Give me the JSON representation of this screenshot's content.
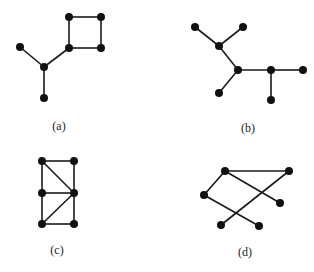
{
  "style": {
    "edge_color": "#1a1a1a",
    "node_color": "#111111",
    "node_radius": 4,
    "edge_width": 1.6
  },
  "graphs": [
    {
      "label": "(a)",
      "label_pos": [
        59,
        126
      ],
      "nodes": [
        [
          69,
          17
        ],
        [
          101,
          17
        ],
        [
          69,
          48
        ],
        [
          101,
          48
        ],
        [
          44,
          67
        ],
        [
          20,
          47
        ],
        [
          44,
          98
        ]
      ],
      "edges": [
        [
          0,
          1
        ],
        [
          1,
          3
        ],
        [
          3,
          2
        ],
        [
          2,
          0
        ],
        [
          2,
          4
        ],
        [
          5,
          4
        ],
        [
          4,
          6
        ]
      ]
    },
    {
      "label": "(b)",
      "label_pos": [
        248,
        128
      ],
      "nodes": [
        [
          195,
          27
        ],
        [
          243,
          27
        ],
        [
          219,
          46
        ],
        [
          238,
          70
        ],
        [
          271,
          70
        ],
        [
          303,
          70
        ],
        [
          219,
          93
        ],
        [
          271,
          100
        ]
      ],
      "edges": [
        [
          0,
          2
        ],
        [
          1,
          2
        ],
        [
          2,
          3
        ],
        [
          3,
          6
        ],
        [
          3,
          4
        ],
        [
          4,
          5
        ],
        [
          4,
          7
        ]
      ]
    },
    {
      "label": "(c)",
      "label_pos": [
        57,
        250
      ],
      "nodes": [
        [
          42,
          161
        ],
        [
          74,
          161
        ],
        [
          42,
          193
        ],
        [
          74,
          193
        ],
        [
          42,
          224
        ],
        [
          74,
          224
        ]
      ],
      "edges": [
        [
          0,
          1
        ],
        [
          0,
          2
        ],
        [
          2,
          4
        ],
        [
          1,
          3
        ],
        [
          3,
          5
        ],
        [
          0,
          3
        ],
        [
          2,
          3
        ],
        [
          3,
          4
        ],
        [
          4,
          5
        ]
      ]
    },
    {
      "label": "(d)",
      "label_pos": [
        245,
        252
      ],
      "nodes": [
        [
          225,
          171
        ],
        [
          289,
          171
        ],
        [
          204,
          195
        ],
        [
          280,
          203
        ],
        [
          221,
          225
        ],
        [
          259,
          226
        ]
      ],
      "edges": [
        [
          0,
          1
        ],
        [
          0,
          2
        ],
        [
          0,
          3
        ],
        [
          1,
          4
        ],
        [
          2,
          5
        ]
      ]
    }
  ]
}
